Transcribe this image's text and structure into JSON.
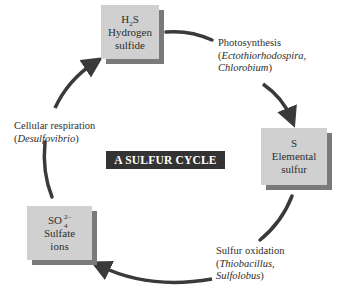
{
  "title": "A SULFUR CYCLE",
  "nodes": [
    {
      "id": "h2s",
      "formula_base": "H",
      "formula_sub": "2",
      "formula_tail": "S",
      "name_line1": "Hydrogen",
      "name_line2": "sulfide"
    },
    {
      "id": "s",
      "formula": "S",
      "name_line1": "Elemental",
      "name_line2": "sulfur"
    },
    {
      "id": "so4",
      "formula_base": "SO",
      "formula_sub": "4",
      "formula_sup": "2–",
      "name_line1": "Sulfate",
      "name_line2": "ions"
    }
  ],
  "processes": [
    {
      "id": "photosynthesis",
      "name": "Photosynthesis",
      "organisms_line1": "Ectothiorhodospira,",
      "organisms_line2": "Chlorobium",
      "open": "(",
      "close": ")"
    },
    {
      "id": "sulfur-oxidation",
      "name": "Sulfur oxidation",
      "organisms_line1": "Thiobacillus,",
      "organisms_line2": "Sulfolobus",
      "open": "(",
      "close": ")"
    },
    {
      "id": "cellular-respiration",
      "name": "Cellular respiration",
      "organisms_line1": "Desulfovibrio",
      "open": "(",
      "close": ")"
    }
  ],
  "colors": {
    "box_fill": "#d0d0d0",
    "box_shadow": "#7a7a7a",
    "arrow": "#3a3a3a",
    "title_bg": "#333333",
    "title_text": "#ffffff"
  }
}
